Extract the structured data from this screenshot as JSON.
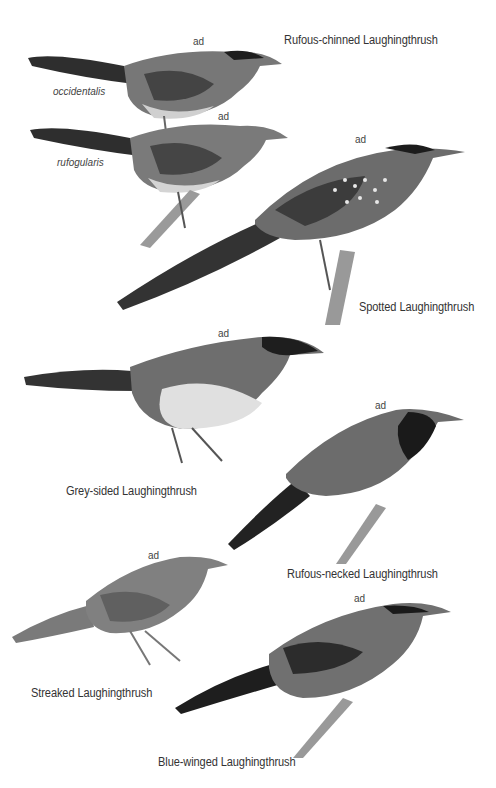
{
  "plate": {
    "colors": {
      "background": "#ffffff",
      "text": "#333333",
      "bird_dark": "#2a2a2a",
      "bird_mid": "#6a6a6a",
      "bird_light": "#bdbdbd",
      "branch": "#8c8c8c"
    },
    "age_label": "ad",
    "species": [
      {
        "name": "Rufous-chinned Laughingthrush",
        "subspecies": [
          "occidentalis",
          "rufogularis"
        ],
        "age_labels": [
          "ad",
          "ad"
        ]
      },
      {
        "name": "Spotted Laughingthrush",
        "age_label": "ad"
      },
      {
        "name": "Grey-sided Laughingthrush",
        "age_label": "ad"
      },
      {
        "name": "Rufous-necked Laughingthrush",
        "age_label": "ad"
      },
      {
        "name": "Streaked Laughingthrush",
        "age_label": "ad"
      },
      {
        "name": "Blue-winged Laughingthrush",
        "age_label": "ad"
      }
    ]
  }
}
